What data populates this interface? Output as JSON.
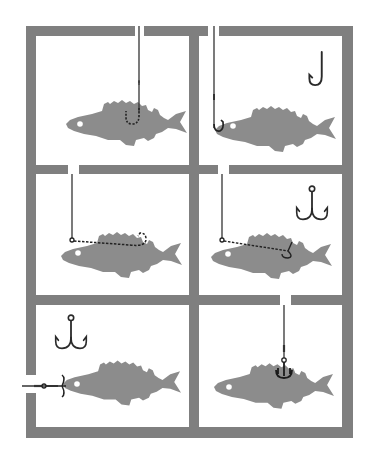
{
  "figure": {
    "title": "",
    "colors": {
      "background": "#ffffff",
      "frame": "#7f7f7f",
      "fish": "#8c8c8c",
      "line": "#333333",
      "hook": "#2a2a2a",
      "eye": "#ffffff"
    },
    "grid": {
      "rows": 3,
      "cols": 2
    },
    "panels": [
      {
        "id": "top-left",
        "row": 1,
        "col": 1,
        "rig": "single hook embedded in back, line from above",
        "loose_hook_icon": "none"
      },
      {
        "id": "top-right",
        "row": 1,
        "col": 2,
        "rig": "single hook through lips, line from above",
        "loose_hook_icon": "single-hook"
      },
      {
        "id": "middle-left",
        "row": 2,
        "col": 1,
        "rig": "single hook threaded along back, line from above",
        "loose_hook_icon": "none"
      },
      {
        "id": "middle-right",
        "row": 2,
        "col": 2,
        "rig": "treble hook threaded along back, line from above",
        "loose_hook_icon": "treble-hook"
      },
      {
        "id": "bottom-left",
        "row": 3,
        "col": 1,
        "rig": "treble hook in mouth, line from left",
        "loose_hook_icon": "treble-hook"
      },
      {
        "id": "bottom-right",
        "row": 3,
        "col": 2,
        "rig": "treble hook in back, line from above",
        "loose_hook_icon": "none"
      }
    ]
  }
}
